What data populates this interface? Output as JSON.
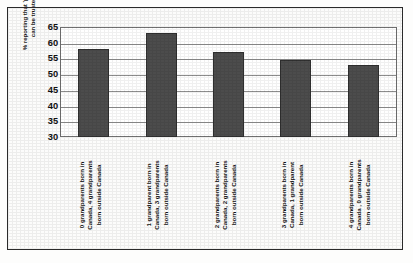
{
  "chart_data": {
    "type": "bar",
    "title": "",
    "xlabel": "",
    "ylabel": "% reporting that 'people\ncan be trusted'",
    "ylim": [
      30,
      65
    ],
    "yticks": [
      65,
      60,
      55,
      50,
      45,
      40,
      35,
      30
    ],
    "grid": true,
    "legend": false,
    "categories": [
      "0 grandparents born in\nCanada, 4 grandparents\nborn outside Canada",
      "1 grandparent born in\nCanada, 3 grandparents\nborn outside Canada",
      "2 grandparents  born in\nCanada, 2 grandparents\nborn outside Canada",
      "3 grandparents  born in\nCanada, 1 grandparent\nborn  outside Canada",
      "4 grandparents  born in\nCanada , 0 grandparents\nborn outside Canada"
    ],
    "values": [
      58,
      63,
      57,
      54.5,
      53
    ],
    "bar_color": "#4c4c4c",
    "plot_background": "#ffffff",
    "gridline_color": "#8d8d8d",
    "axis_color": "#707070",
    "frame_color": "#2a2a2a"
  }
}
